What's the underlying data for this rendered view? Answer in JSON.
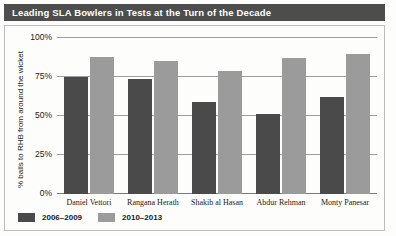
{
  "title": "Leading SLA Bowlers in Tests at the Turn of the Decade",
  "chart_data": {
    "type": "bar",
    "title": "Leading SLA Bowlers in Tests at the Turn of the Decade",
    "subtitle": "",
    "xlabel": "",
    "ylabel": "% balls to RHB from around the wicket",
    "categories": [
      "Daniel Vettori",
      "Rangana Herath",
      "Shakib al Hasan",
      "Abdur Rehman",
      "Monty Panesar"
    ],
    "series": [
      {
        "name": "2006–2009",
        "color": "#4a4a4a",
        "values": [
          75,
          74,
          59,
          51,
          62
        ]
      },
      {
        "name": "2010–2013",
        "color": "#9b9b9b",
        "values": [
          88,
          85,
          79,
          87,
          90
        ]
      }
    ],
    "ylim": [
      0,
      100
    ],
    "ytick_labels": [
      "100%",
      "75%",
      "50%",
      "25%",
      "0%"
    ],
    "ytick_values": [
      100,
      75,
      50,
      25,
      0
    ],
    "grid": true,
    "legend_position": "bottom-left"
  },
  "legend": [
    {
      "label": "2006–2009"
    },
    {
      "label": "2010–2013"
    }
  ]
}
